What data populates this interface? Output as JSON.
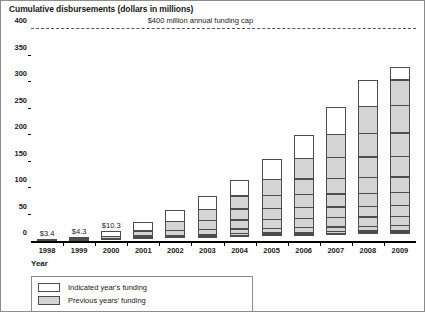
{
  "chart_data": {
    "type": "bar",
    "title": "Cumulative disbursements (dollars in millions)",
    "xlabel": "Year",
    "ylabel": "",
    "ylim": [
      0,
      400
    ],
    "yticks": [
      0,
      50,
      100,
      150,
      200,
      250,
      300,
      350,
      400
    ],
    "grid": false,
    "stacked": true,
    "legend_position": "below-axis-left",
    "categories": [
      "1998",
      "1999",
      "2000",
      "2001",
      "2002",
      "2003",
      "2004",
      "2005",
      "2006",
      "2007",
      "2008",
      "2009"
    ],
    "series": [
      {
        "name": "Indicated year's funding",
        "color": "#ffffff",
        "values": [
          3.4,
          4.3,
          10.3,
          18.6,
          21.6,
          25.9,
          31.0,
          40.1,
          45.1,
          53.3,
          49.6,
          24.2
        ]
      },
      {
        "name": "Previous years' funding",
        "color": "#d4d4d4",
        "values": [
          0.0,
          3.4,
          7.7,
          18.0,
          36.6,
          58.2,
          84.1,
          115.1,
          155.2,
          200.3,
          253.6,
          303.2
        ]
      }
    ],
    "cumulative_totals": [
      3.4,
      7.7,
      18.0,
      36.6,
      58.2,
      84.1,
      115.1,
      155.2,
      200.3,
      253.6,
      303.2,
      327.4
    ],
    "bar_labels": [
      "$3.4",
      "$4.3",
      "$10.3",
      "$18.6",
      "$21.6",
      "$25.9",
      "$31.0",
      "$40.1",
      "$45.1",
      "$53.3",
      "$49.6",
      "$24.2"
    ],
    "annotations": [
      {
        "text": "$400 million annual funding cap",
        "y": 400,
        "style": "dashed-horizontal-line"
      }
    ]
  },
  "legend": {
    "items": [
      {
        "label": "Indicated year's funding",
        "swatch": "white"
      },
      {
        "label": "Previous years' funding",
        "swatch": "gray"
      }
    ]
  }
}
